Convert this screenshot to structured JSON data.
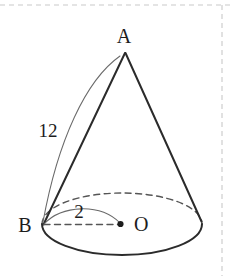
{
  "figure": {
    "background_color": "#ffffff",
    "stroke_color": "#2b2b2b",
    "thin_stroke_color": "#4a4a4a",
    "hidden_stroke_color": "#555555",
    "border_color": "#c9c9c9",
    "width": 232,
    "height": 276
  },
  "labels": {
    "apex": "A",
    "base_left": "B",
    "center": "O",
    "slant_length": "12",
    "radius_length": "2"
  },
  "geometry": {
    "apex_x": 125,
    "apex_y": 52,
    "center_x": 122,
    "center_y": 224,
    "ellipse_rx": 80,
    "ellipse_ry": 31,
    "left_base_x": 43,
    "left_base_y": 224,
    "right_base_x": 201,
    "right_base_y": 222
  },
  "annotations": {
    "slant_leader": "curved-arc-from-apex-to-B",
    "radius_leader": "curved-arc-from-B-to-O",
    "radius_line": "dashed-segment-B-to-O",
    "center_dot": "filled-point-at-O",
    "hidden_base_arc": "dashed-upper-half-of-base-ellipse"
  }
}
